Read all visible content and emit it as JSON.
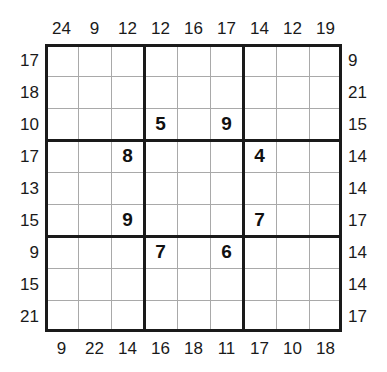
{
  "puzzle": {
    "type": "frame-sudoku",
    "size": 9,
    "box_size": 3,
    "clues": {
      "top": [
        "24",
        "9",
        "12",
        "12",
        "16",
        "17",
        "14",
        "12",
        "19"
      ],
      "bottom": [
        "9",
        "22",
        "14",
        "16",
        "18",
        "11",
        "17",
        "10",
        "18"
      ],
      "left": [
        "17",
        "18",
        "10",
        "17",
        "13",
        "15",
        "9",
        "15",
        "21"
      ],
      "right": [
        "9",
        "21",
        "15",
        "14",
        "14",
        "17",
        "14",
        "14",
        "17"
      ]
    },
    "givens": [
      [
        "",
        "",
        "",
        "",
        "",
        "",
        "",
        "",
        ""
      ],
      [
        "",
        "",
        "",
        "",
        "",
        "",
        "",
        "",
        ""
      ],
      [
        "",
        "",
        "",
        "5",
        "",
        "9",
        "",
        "",
        ""
      ],
      [
        "",
        "",
        "8",
        "",
        "",
        "",
        "4",
        "",
        ""
      ],
      [
        "",
        "",
        "",
        "",
        "",
        "",
        "",
        "",
        ""
      ],
      [
        "",
        "",
        "9",
        "",
        "",
        "",
        "7",
        "",
        ""
      ],
      [
        "",
        "",
        "",
        "7",
        "",
        "6",
        "",
        "",
        ""
      ],
      [
        "",
        "",
        "",
        "",
        "",
        "",
        "",
        "",
        ""
      ],
      [
        "",
        "",
        "",
        "",
        "",
        "",
        "",
        "",
        ""
      ]
    ],
    "colors": {
      "border": "#1a1a1a",
      "grid_line": "#a9a9a9",
      "given_digit": "#111111",
      "clue_text": "#1a1a1a",
      "background": "#ffffff"
    }
  }
}
